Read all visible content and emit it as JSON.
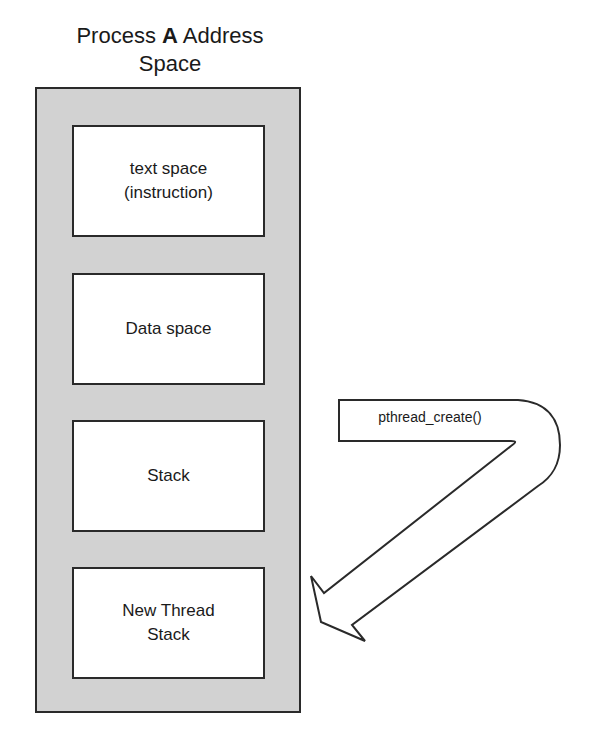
{
  "title": {
    "prefix": "Process",
    "bold": "A",
    "suffix": "Address",
    "line2": "Space"
  },
  "segments": [
    {
      "line1": "text space",
      "line2": "(instruction)"
    },
    {
      "line1": "Data space",
      "line2": ""
    },
    {
      "line1": "Stack",
      "line2": ""
    },
    {
      "line1": "New Thread",
      "line2": "Stack"
    }
  ],
  "arrow": {
    "label": "pthread_create()"
  },
  "colors": {
    "container_fill": "#d2d2d2",
    "segment_fill": "#ffffff",
    "stroke": "#2a2a2a"
  }
}
